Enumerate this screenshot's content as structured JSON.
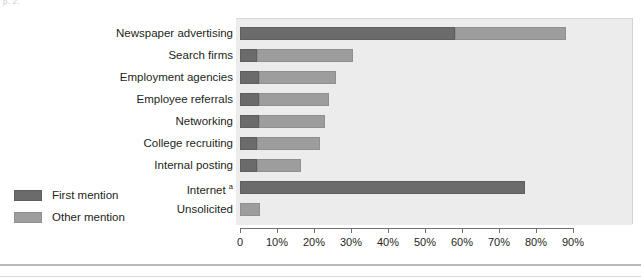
{
  "page": {
    "ghost_text": "p. 2."
  },
  "legend": {
    "items": [
      {
        "label": "First mention",
        "key": "first",
        "color": "#6b6b6b"
      },
      {
        "label": "Other mention",
        "key": "other",
        "color": "#9d9d9d"
      }
    ]
  },
  "chart_data": {
    "type": "bar",
    "orientation": "horizontal",
    "stacked": true,
    "title": "",
    "xlabel": "",
    "ylabel": "",
    "xlim": [
      0,
      90
    ],
    "xticks": [
      0,
      10,
      20,
      30,
      40,
      50,
      60,
      70,
      80,
      90
    ],
    "xticklabels": [
      "0",
      "10%",
      "20%",
      "30%",
      "40%",
      "50%",
      "60%",
      "70%",
      "80%",
      "90%"
    ],
    "grid": false,
    "legend_position": "left-outside",
    "categories": [
      "Newspaper advertising",
      "Search firms",
      "Employment agencies",
      "Employee referrals",
      "Networking",
      "College recruiting",
      "Internal posting",
      "Internet",
      "Unsolicited"
    ],
    "category_footnotes": {
      "Internet": "a"
    },
    "series": [
      {
        "name": "First mention",
        "color": "#6b6b6b",
        "values": [
          58,
          4.5,
          5,
          5,
          5,
          4.5,
          4.5,
          77,
          0
        ]
      },
      {
        "name": "Other mention",
        "color": "#9d9d9d",
        "values": [
          30,
          26,
          21,
          19,
          18,
          17,
          12,
          0,
          5.5
        ]
      }
    ],
    "totals": [
      88,
      30.5,
      26,
      24,
      23,
      21.5,
      16.5,
      77,
      5.5
    ]
  }
}
